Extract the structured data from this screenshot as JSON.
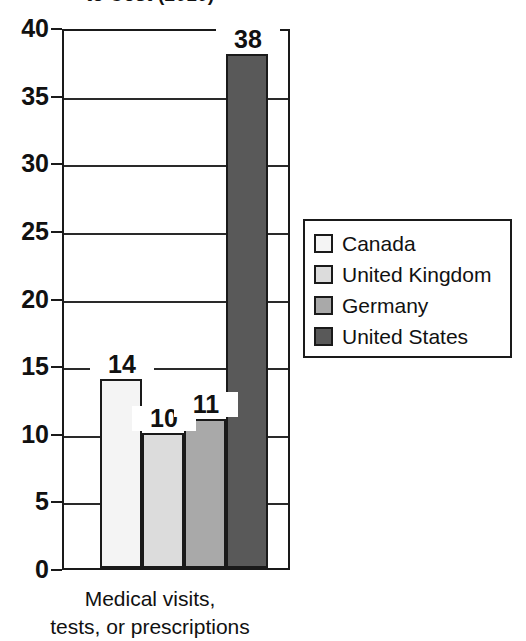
{
  "chart_data": {
    "type": "bar",
    "title": "to Cost (2010)",
    "xlabel": "Medical visits, tests, or prescriptions",
    "ylabel": "",
    "categories": [
      "Canada",
      "United Kingdom",
      "Germany",
      "United States"
    ],
    "values": [
      14,
      10,
      11,
      38
    ],
    "value_labels": [
      "14",
      "10",
      "11",
      "38"
    ],
    "ylim": [
      0,
      40
    ],
    "yticks": [
      40,
      35,
      30,
      25,
      20,
      15,
      10,
      5,
      0
    ],
    "ytick_labels": [
      "40",
      "35",
      "30",
      "25",
      "20",
      "15",
      "10",
      "5",
      "0"
    ],
    "grid": true,
    "legend_position": "right",
    "series_colors": [
      "#f4f4f4",
      "#dcdcdc",
      "#a9a9a9",
      "#595959"
    ],
    "axis_color": "#1a1a1a"
  },
  "x_caption": {
    "line1": "Medical visits,",
    "line2": "tests, or prescriptions"
  },
  "legend": {
    "items": [
      {
        "label": "Canada",
        "color": "#f4f4f4"
      },
      {
        "label": "United Kingdom",
        "color": "#dcdcdc"
      },
      {
        "label": "Germany",
        "color": "#a9a9a9"
      },
      {
        "label": "United States",
        "color": "#595959"
      }
    ]
  }
}
